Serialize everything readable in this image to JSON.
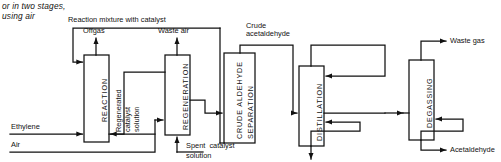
{
  "figure": {
    "caption": "or in two stages,\nusing air",
    "units": [
      {
        "id": "reaction",
        "label": "REACTION"
      },
      {
        "id": "regeneration",
        "label": "REGENERATION"
      },
      {
        "id": "separation",
        "label": "CRUDE ALDEHYDE\nSEPARATION",
        "line1": "CRUDE ALDEHYDE",
        "line2": "SEPARATION"
      },
      {
        "id": "distillation",
        "label": "DISTILLATION"
      },
      {
        "id": "degassing",
        "label": "DEGASSING"
      }
    ],
    "streams": {
      "reaction_mixture": "Reaction mixture with catalyst",
      "offgas": "Offgas",
      "waste_air": "Waste air",
      "crude_acetaldehyde_l1": "Crude",
      "crude_acetaldehyde_l2": "acetaldehyde",
      "waste_gas": "Waste gas",
      "ethylene": "Ethylene",
      "air": "Air",
      "regenerated_l1": "Regenerated",
      "regenerated_l2": "catalyst",
      "regenerated_l3": "solution",
      "spent_l1": "Spent  catalyst",
      "spent_l2": "solution",
      "acetaldehyde": "Acetaldehyde"
    },
    "colors": {
      "ink": "#111111",
      "background": "#ffffff"
    }
  }
}
